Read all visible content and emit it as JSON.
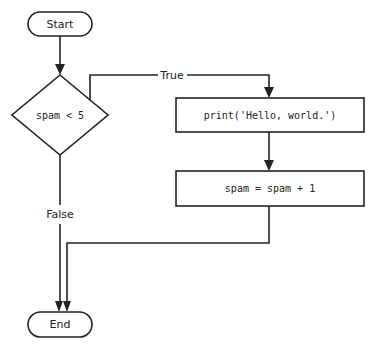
{
  "diagram": {
    "type": "flowchart",
    "nodes": {
      "start": {
        "label": "Start",
        "shape": "terminal"
      },
      "condition": {
        "label": "spam < 5",
        "shape": "decision"
      },
      "print": {
        "label": "print('Hello, world.')",
        "shape": "process"
      },
      "increment": {
        "label": "spam = spam + 1",
        "shape": "process"
      },
      "end": {
        "label": "End",
        "shape": "terminal"
      }
    },
    "edges": {
      "true_label": "True",
      "false_label": "False"
    },
    "colors": {
      "stroke": "#222222",
      "background": "#ffffff"
    }
  }
}
